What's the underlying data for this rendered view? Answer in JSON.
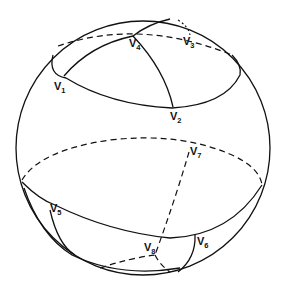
{
  "figure": {
    "vertices": [
      {
        "id": "v1",
        "letter": "V",
        "sub": "1"
      },
      {
        "id": "v2",
        "letter": "V",
        "sub": "2"
      },
      {
        "id": "v3",
        "letter": "V",
        "sub": "3"
      },
      {
        "id": "v4",
        "letter": "V",
        "sub": "4"
      },
      {
        "id": "v5",
        "letter": "V",
        "sub": "5"
      },
      {
        "id": "v6",
        "letter": "V",
        "sub": "6"
      },
      {
        "id": "v7",
        "letter": "V",
        "sub": "7"
      },
      {
        "id": "v8",
        "letter": "V",
        "sub": "8"
      }
    ],
    "colors": {
      "line": "#111111",
      "background": "#ffffff"
    }
  }
}
